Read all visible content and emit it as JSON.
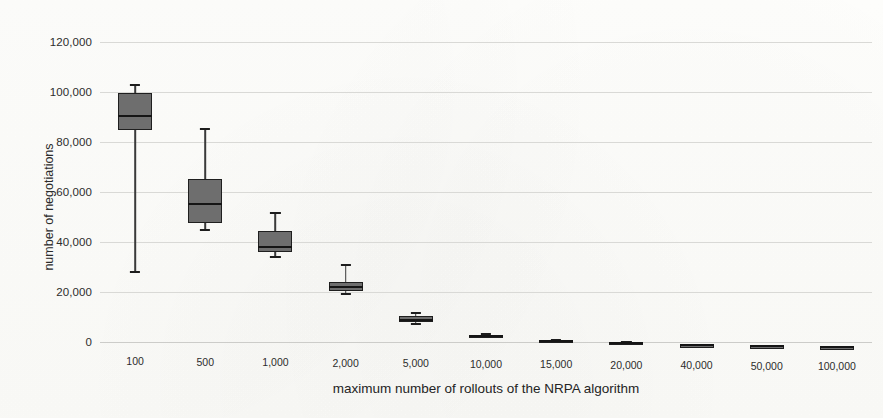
{
  "chart_data": {
    "type": "box",
    "title": "",
    "xlabel": "maximum number of rollouts of the NRPA algorithm",
    "ylabel": "number of negotiations",
    "ylim": [
      0,
      120000
    ],
    "yticks": [
      "0",
      "20,000",
      "40,000",
      "60,000",
      "80,000",
      "100,000",
      "120,000"
    ],
    "ytick_values": [
      0,
      20000,
      40000,
      60000,
      80000,
      100000,
      120000
    ],
    "grid": true,
    "legend": "none",
    "categories": [
      "100",
      "500",
      "1,000",
      "2,000",
      "5,000",
      "10,000",
      "15,000",
      "20,000",
      "40,000",
      "50,000",
      "100,000"
    ],
    "boxes": [
      {
        "category": "100",
        "whisker_low": 28000,
        "q1": 85000,
        "median": 90500,
        "q3": 99500,
        "whisker_high": 103000
      },
      {
        "category": "500",
        "whisker_low": 45000,
        "q1": 48000,
        "median": 55500,
        "q3": 65500,
        "whisker_high": 85500
      },
      {
        "category": "1,000",
        "whisker_low": 34500,
        "q1": 36500,
        "median": 38500,
        "q3": 45000,
        "whisker_high": 52000
      },
      {
        "category": "2,000",
        "whisker_low": 20000,
        "q1": 21000,
        "median": 22500,
        "q3": 24500,
        "whisker_high": 31500
      },
      {
        "category": "5,000",
        "whisker_low": 8000,
        "q1": 8800,
        "median": 9800,
        "q3": 11200,
        "whisker_high": 12500
      },
      {
        "category": "10,000",
        "whisker_low": 3000,
        "q1": 3200,
        "median": 3500,
        "q3": 3900,
        "whisker_high": 4200
      },
      {
        "category": "15,000",
        "whisker_low": 1600,
        "q1": 1750,
        "median": 1900,
        "q3": 2100,
        "whisker_high": 2300
      },
      {
        "category": "20,000",
        "whisker_low": 1000,
        "q1": 1100,
        "median": 1250,
        "q3": 1400,
        "whisker_high": 1550
      },
      {
        "category": "40,000",
        "whisker_low": 400,
        "q1": 450,
        "median": 520,
        "q3": 600,
        "whisker_high": 680
      },
      {
        "category": "50,000",
        "whisker_low": 250,
        "q1": 300,
        "median": 360,
        "q3": 430,
        "whisker_high": 500
      },
      {
        "category": "100,000",
        "whisker_low": 60,
        "q1": 90,
        "median": 130,
        "q3": 180,
        "whisker_high": 230
      }
    ]
  }
}
